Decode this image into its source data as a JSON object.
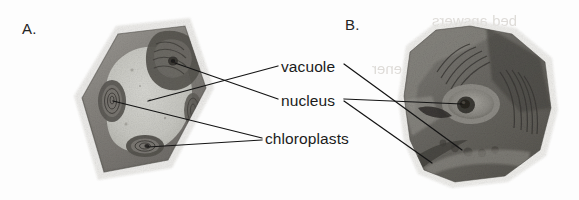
{
  "figure": {
    "background_color": "#fdfdfd",
    "ink_color": "#1b1b1b",
    "type": "micrograph-figure"
  },
  "panels": [
    {
      "id": "a",
      "letter": "A.",
      "cell_shape": "rotated-square",
      "tone": "light-grey-vacuole"
    },
    {
      "id": "b",
      "letter": "B.",
      "cell_shape": "irregular-blob",
      "tone": "dark-grey"
    }
  ],
  "labels": [
    {
      "id": "vacuole",
      "text": "vacuole"
    },
    {
      "id": "nucleus",
      "text": "nucleus"
    },
    {
      "id": "chloroplasts",
      "text": "chloroplasts"
    }
  ],
  "ghost_text": [
    {
      "id": "g1",
      "text": "bed answers"
    },
    {
      "id": "g2",
      "text": "chemical ener"
    },
    {
      "id": "g3",
      "text": "kinet"
    },
    {
      "id": "g4",
      "text": "nom"
    },
    {
      "id": "g5",
      "text": "opm"
    },
    {
      "id": "g6",
      "text": "lar"
    }
  ],
  "colors": {
    "page_background": "#fdfdfd",
    "text": "#1b1b1b",
    "leader_line": "#141414",
    "ghost": "#d9d6d2",
    "cell_a_wall": "#8f8d89",
    "cell_a_vacuole": "#c9c9c4",
    "cell_b_body": "#6e6c68"
  }
}
